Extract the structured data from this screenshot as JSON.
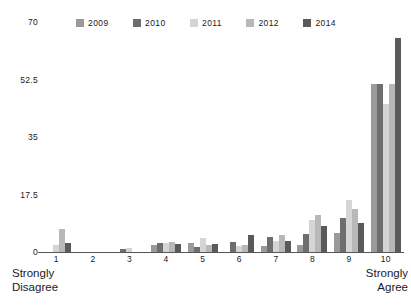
{
  "chart_data": {
    "type": "bar",
    "title": "",
    "subtitle": "",
    "xlabel": "",
    "ylabel": "",
    "categories": [
      "1",
      "2",
      "3",
      "4",
      "5",
      "6",
      "7",
      "8",
      "9",
      "10"
    ],
    "x_axis_low_label": [
      "Strongly",
      "Disagree"
    ],
    "x_axis_high_label": [
      "Strongly",
      "Agree"
    ],
    "ylim": [
      0,
      70
    ],
    "yticks": [
      "0",
      "17.5",
      "35",
      "52.5",
      "70"
    ],
    "ytick_values": [
      0,
      17.5,
      35,
      52.5,
      70
    ],
    "grid": false,
    "legend_position": "top",
    "series": [
      {
        "name": "2009",
        "color": "#9a9a9a",
        "values": [
          0,
          0,
          0,
          2.2,
          2.6,
          0,
          1.8,
          2.2,
          5.8,
          51.0
        ]
      },
      {
        "name": "2010",
        "color": "#6e6e6e",
        "values": [
          0,
          0,
          0.9,
          2.6,
          1.5,
          3.0,
          4.6,
          5.4,
          10.5,
          51.0
        ]
      },
      {
        "name": "2011",
        "color": "#d5d5d5",
        "values": [
          2.0,
          0,
          1.3,
          2.8,
          4.4,
          1.8,
          3.4,
          9.6,
          15.7,
          45.0
        ]
      },
      {
        "name": "2012",
        "color": "#b8b8b8",
        "values": [
          7.0,
          0,
          0,
          3.2,
          2.0,
          2.0,
          5.2,
          11.3,
          13.1,
          51.0
        ]
      },
      {
        "name": "2014",
        "color": "#5a5a5a",
        "values": [
          2.6,
          0,
          0,
          2.4,
          2.4,
          5.2,
          3.5,
          7.8,
          8.7,
          65.0
        ]
      }
    ]
  }
}
